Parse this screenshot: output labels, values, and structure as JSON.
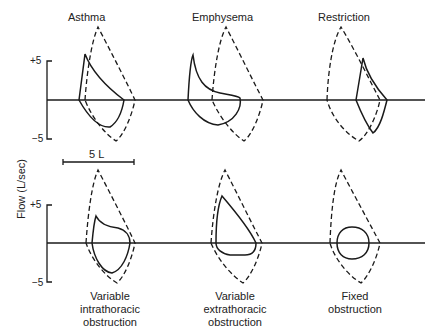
{
  "figure": {
    "y_axis_label": "Flow (L/sec)",
    "y_ticks": [
      "+5",
      "−5"
    ],
    "scale_bar_label": "5 L",
    "line_color": "#1a1a1a",
    "panels": [
      {
        "id": "asthma",
        "label": "Asthma",
        "position": "top-left"
      },
      {
        "id": "emphysema",
        "label": "Emphysema",
        "position": "top-center"
      },
      {
        "id": "restriction",
        "label": "Restriction",
        "position": "top-right"
      },
      {
        "id": "variable-intrathoracic",
        "caption_lines": [
          "Variable",
          "intrathoracic",
          "obstruction"
        ],
        "position": "bottom-left"
      },
      {
        "id": "variable-extrathoracic",
        "caption_lines": [
          "Variable",
          "extrathoracic",
          "obstruction"
        ],
        "position": "bottom-center"
      },
      {
        "id": "fixed",
        "caption_lines": [
          "Fixed",
          "obstruction"
        ],
        "position": "bottom-right"
      }
    ],
    "legend_note": "dashed = normal loop, solid = disease loop"
  }
}
